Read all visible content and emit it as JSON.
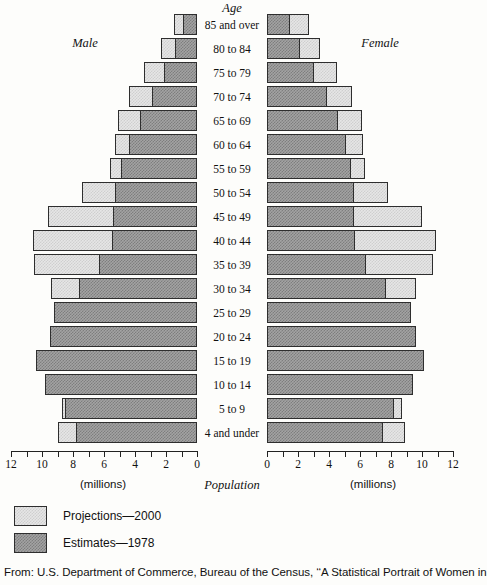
{
  "titles": {
    "age": "Age",
    "male": "Male",
    "female": "Female",
    "population": "Population",
    "millions_left": "(millions)",
    "millions_right": "(millions)"
  },
  "legend": [
    {
      "key": "projections",
      "label": "Projections—2000",
      "style": "light"
    },
    {
      "key": "estimates",
      "label": "Estimates—1978",
      "style": "dark"
    }
  ],
  "source": "From: U.S. Department of Commerce, Bureau of the Census, ‘‘A Statistical Portrait of Women in",
  "axis": {
    "ticks": [
      "12",
      "10",
      "8",
      "6",
      "4",
      "2",
      "0"
    ],
    "ticks_right": [
      "0",
      "2",
      "4",
      "6",
      "8",
      "10",
      "12"
    ],
    "minor_between": true,
    "max": 12,
    "unit": "millions"
  },
  "colors": {
    "light": "#e6e6e6",
    "dark": "#a3a3a3",
    "outline": "#2e2e2e",
    "text": "#111111",
    "page": "#fdfdfb"
  },
  "chart_data": {
    "type": "bar",
    "subtype": "population-pyramid",
    "title": "Age",
    "xlabel": "Population (millions)",
    "ylabel": "Age",
    "xlim": [
      0,
      12
    ],
    "grid": false,
    "legend_position": "bottom-left",
    "categories": [
      "85 and over",
      "80 to 84",
      "75 to 79",
      "70 to 74",
      "65 to 69",
      "60 to 64",
      "55 to 59",
      "50 to 54",
      "45 to 49",
      "40 to 44",
      "35 to 39",
      "30 to 34",
      "25 to 29",
      "20 to 24",
      "15 to 19",
      "10 to 14",
      "5 to 9",
      "4 and under"
    ],
    "series": [
      {
        "name": "Male — Estimates—1978",
        "side": "male",
        "style": "dark",
        "values": [
          0.9,
          1.4,
          2.1,
          2.9,
          3.7,
          4.4,
          4.9,
          5.3,
          5.4,
          5.5,
          6.3,
          7.6,
          9.2,
          9.5,
          10.4,
          9.8,
          8.5,
          7.8
        ]
      },
      {
        "name": "Male — Projections—2000",
        "side": "male",
        "style": "light",
        "values": [
          1.5,
          2.3,
          3.4,
          4.4,
          5.1,
          5.3,
          5.6,
          7.4,
          9.6,
          10.6,
          10.5,
          9.4,
          8.6,
          9.0,
          9.6,
          8.8,
          8.7,
          9.0
        ]
      },
      {
        "name": "Female — Estimates—1978",
        "side": "female",
        "style": "dark",
        "values": [
          1.5,
          2.1,
          3.0,
          3.9,
          4.6,
          5.1,
          5.4,
          5.6,
          5.6,
          5.7,
          6.4,
          7.7,
          9.3,
          9.6,
          10.1,
          9.4,
          8.2,
          7.5
        ]
      },
      {
        "name": "Female — Projections—2000",
        "side": "female",
        "style": "light",
        "values": [
          2.7,
          3.4,
          4.5,
          5.5,
          6.1,
          6.2,
          6.3,
          7.8,
          10.0,
          10.9,
          10.7,
          9.6,
          8.8,
          9.2,
          9.6,
          8.9,
          8.7,
          8.9
        ]
      }
    ]
  }
}
